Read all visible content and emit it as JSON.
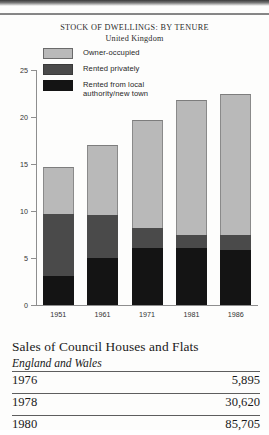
{
  "chart_data": {
    "type": "bar",
    "stacked": true,
    "title": "STOCK OF DWELLINGS: BY TENURE",
    "subtitle": "United Kingdom",
    "xlabel": "",
    "ylabel": "",
    "categories": [
      "1951",
      "1961",
      "1971",
      "1981",
      "1986"
    ],
    "ylim": [
      0,
      25
    ],
    "yticks": [
      "0",
      "5",
      "10",
      "15",
      "20",
      "25"
    ],
    "grid": false,
    "legend_position": "top-left",
    "series": [
      {
        "name": "Rented from local authority/new town",
        "color": "#141414",
        "values": [
          3.1,
          5.0,
          6.1,
          6.1,
          5.9
        ]
      },
      {
        "name": "Rented privately",
        "color": "#4a4a4a",
        "values": [
          6.6,
          4.6,
          2.1,
          1.3,
          1.5
        ]
      },
      {
        "name": "Owner-occupied",
        "color": "#b9b9b9",
        "values": [
          5.0,
          7.4,
          11.5,
          14.4,
          15.1
        ]
      }
    ],
    "totals": [
      14.7,
      17.0,
      19.7,
      21.8,
      22.5
    ]
  },
  "chart": {
    "title": "STOCK OF DWELLINGS: BY TENURE",
    "subtitle": "United Kingdom",
    "legend": [
      {
        "label": "Owner-occupied",
        "swatch": "owner-occupied-swatch"
      },
      {
        "label": "Rented privately",
        "swatch": "rented-privately-swatch"
      },
      {
        "label": "Rented from local authority/new town",
        "swatch": "rented-local-authority-swatch"
      }
    ],
    "legend_line1": "Rented from local",
    "legend_line2": "authority/new town",
    "y_labels": [
      "25",
      "20",
      "15",
      "10",
      "5",
      "0"
    ],
    "x_labels": [
      "1951",
      "1961",
      "1971",
      "1981",
      "1986"
    ]
  },
  "table": {
    "title": "Sales of Council Houses and Flats",
    "subtitle": "England and Wales",
    "rows": [
      {
        "year": "1976",
        "value": "5,895"
      },
      {
        "year": "1978",
        "value": "30,620"
      },
      {
        "year": "1980",
        "value": "85,705"
      }
    ]
  }
}
